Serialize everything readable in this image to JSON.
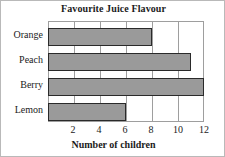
{
  "chart_data": {
    "type": "bar",
    "orientation": "horizontal",
    "title": "Favourite Juice Flavour",
    "xlabel": "Number of children",
    "ylabel": "",
    "categories": [
      "Orange",
      "Peach",
      "Berry",
      "Lemon"
    ],
    "values": [
      8,
      11,
      12,
      6
    ],
    "xlim": [
      0,
      12
    ],
    "xticks": [
      2,
      4,
      6,
      8,
      10,
      12
    ],
    "xtick_labels": [
      "2",
      "4",
      "6",
      "8",
      "10",
      "12"
    ],
    "grid": "vertical",
    "legend": "none",
    "colors": {
      "bar_fill": "#9a9a9a",
      "bar_border": "#2a2a2a",
      "frame": "#9e9e9e",
      "text": "#1b1b1b",
      "background": "#ffffff"
    }
  }
}
